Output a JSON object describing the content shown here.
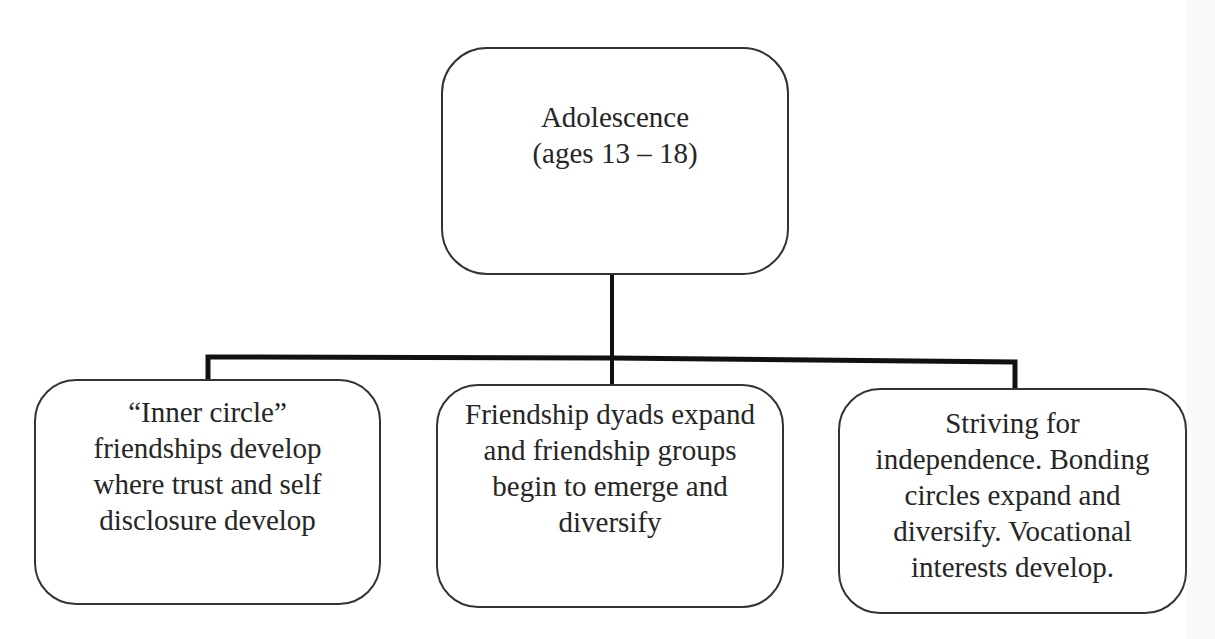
{
  "diagram": {
    "type": "hierarchy-tree",
    "colors": {
      "background": "#ffffff",
      "box_border": "#333333",
      "connector": "#111111",
      "text": "#262626"
    },
    "root": {
      "id": "adolescence",
      "label": "Adolescence\n(ages 13 – 18)"
    },
    "children": [
      {
        "id": "inner-circle",
        "label": "“Inner circle”\nfriendships develop\nwhere trust and self\ndisclosure develop"
      },
      {
        "id": "friendship-dyads",
        "label": "Friendship dyads expand\nand friendship groups\nbegin to emerge and\ndiversify"
      },
      {
        "id": "independence",
        "label": "Striving for\nindependence. Bonding\ncircles expand and\ndiversify. Vocational\ninterests develop."
      }
    ],
    "edges": [
      {
        "from": "adolescence",
        "to": "inner-circle"
      },
      {
        "from": "adolescence",
        "to": "friendship-dyads"
      },
      {
        "from": "adolescence",
        "to": "independence"
      }
    ]
  }
}
